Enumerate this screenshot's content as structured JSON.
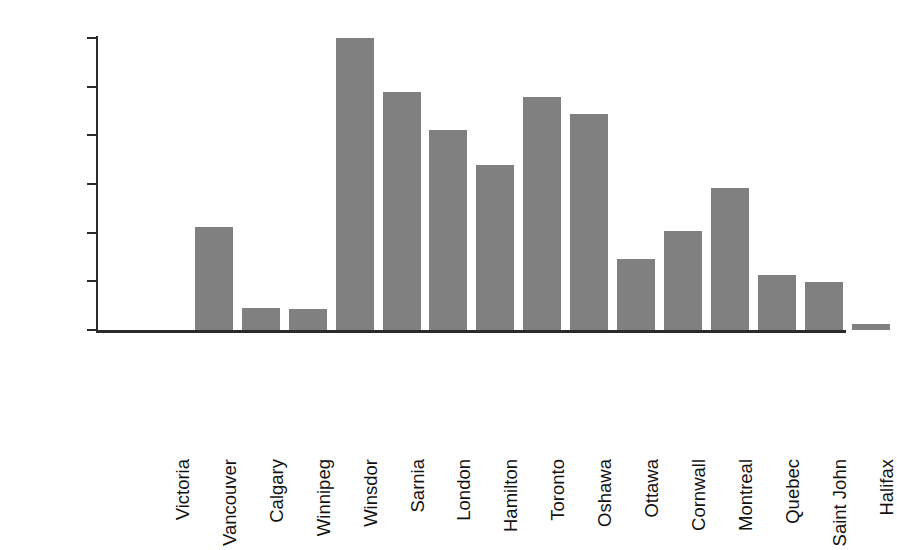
{
  "chart_data": {
    "type": "bar",
    "title": "",
    "subtitle": "",
    "xlabel": "",
    "ylabel": "# of days/year exceeding 82 ppb",
    "ylim": [
      0,
      30
    ],
    "ytick_labels": [
      "0",
      "5",
      "10",
      "15",
      "20",
      "25",
      "30"
    ],
    "ytick_values": [
      0,
      5,
      10,
      15,
      20,
      25,
      30
    ],
    "grid": false,
    "legend": null,
    "bar_color": "#808080",
    "axis_color": "#2b2b2b",
    "background_color": "#ffffff",
    "categories": [
      "Victoria",
      "Vancouver",
      "Calgary",
      "Winnipeg",
      "Winsdor",
      "Sarnia",
      "London",
      "Hamilton",
      "Toronto",
      "Oshawa",
      "Ottawa",
      "Cornwall",
      "Montreal",
      "Quebec",
      "Saint John",
      "Halifax"
    ],
    "values": [
      0,
      10.6,
      2.3,
      2.2,
      30.0,
      24.5,
      20.6,
      17.0,
      23.9,
      22.2,
      7.3,
      10.2,
      14.6,
      5.7,
      4.9,
      0.6
    ]
  }
}
